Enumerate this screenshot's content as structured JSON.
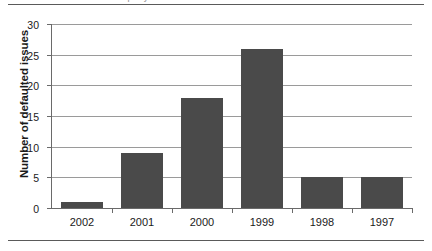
{
  "figure": {
    "caption_fragment": "Number of defaulted issues per year",
    "rule_top_name": "top-rule",
    "rule_bottom_name": "bottom-rule"
  },
  "chart_data": {
    "type": "bar",
    "title": "",
    "subtitle": "",
    "xlabel": "",
    "ylabel": "Number of defaulted issues",
    "categories": [
      "2002",
      "2001",
      "2000",
      "1999",
      "1998",
      "1997"
    ],
    "values": [
      1,
      9,
      18,
      26,
      5,
      5
    ],
    "ylim": [
      0,
      30
    ],
    "ytick_values": [
      0,
      5,
      10,
      15,
      20,
      25,
      30
    ],
    "ytick_labels": [
      "0",
      "5",
      "10",
      "15",
      "20",
      "25",
      "30"
    ],
    "grid": "horizontal",
    "legend": "none",
    "bar_color": "#4a4a4a",
    "gridline_color": "#9a9a9a",
    "axis_color": "#6a6a6a",
    "background_color": "#ffffff"
  }
}
